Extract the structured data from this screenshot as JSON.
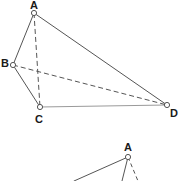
{
  "figure": {
    "canvas": {
      "width": 181,
      "height": 181,
      "background": "#ffffff"
    },
    "style": {
      "solid_edge_color": "#555555",
      "dashed_edge_color": "#555555",
      "faint_edge_color": "#9a9a9a",
      "vertex_stroke": "#555555",
      "vertex_fill": "#ffffff",
      "label_color": "#1a1a1a",
      "edge_width": 1,
      "dash_pattern": "5,3"
    },
    "main": {
      "vertices": [
        {
          "id": "A",
          "label": "A",
          "x": 34,
          "y": 13,
          "label_x": 30,
          "label_y": 0
        },
        {
          "id": "B",
          "label": "B",
          "x": 13,
          "y": 65,
          "label_x": 1,
          "label_y": 58
        },
        {
          "id": "C",
          "label": "C",
          "x": 40,
          "y": 107,
          "label_x": 35,
          "label_y": 114
        },
        {
          "id": "D",
          "label": "D",
          "x": 167,
          "y": 105,
          "label_x": 170,
          "label_y": 108
        }
      ],
      "edges": [
        {
          "from": "A",
          "to": "B",
          "style": "solid",
          "name": "edge-ab"
        },
        {
          "from": "A",
          "to": "D",
          "style": "solid",
          "name": "edge-ad"
        },
        {
          "from": "B",
          "to": "C",
          "style": "solid",
          "name": "edge-bc"
        },
        {
          "from": "C",
          "to": "D",
          "style": "faint",
          "name": "edge-cd"
        },
        {
          "from": "A",
          "to": "C",
          "style": "dashed",
          "name": "edge-ac-hidden"
        },
        {
          "from": "B",
          "to": "D",
          "style": "dashed",
          "name": "edge-bd-hidden"
        }
      ]
    },
    "secondary": {
      "note": "partial figure cropped at bottom edge",
      "vertices": [
        {
          "id": "A2",
          "label": "A",
          "x": 128,
          "y": 157,
          "label_x": 124,
          "label_y": 142
        }
      ],
      "edges": [
        {
          "from": "A2",
          "to": "left",
          "style": "solid",
          "name": "edge-a2-left",
          "x2": 74,
          "y2": 181
        },
        {
          "from": "A2",
          "to": "down",
          "style": "solid",
          "name": "edge-a2-down",
          "x2": 122,
          "y2": 181
        },
        {
          "from": "A2",
          "to": "right",
          "style": "dashed",
          "name": "edge-a2-right",
          "x2": 138,
          "y2": 181
        }
      ]
    }
  }
}
